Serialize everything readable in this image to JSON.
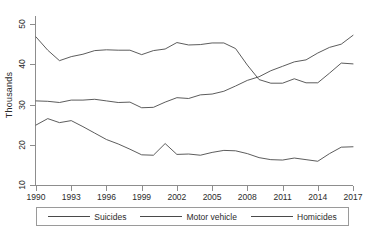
{
  "chart_data": {
    "type": "line",
    "title": "",
    "subtitle": "",
    "xlabel": "",
    "ylabel": "Thousands",
    "xlim": [
      1990,
      2017
    ],
    "ylim": [
      10,
      52
    ],
    "grid": false,
    "legend_position": "bottom",
    "x": [
      1990,
      1991,
      1992,
      1993,
      1994,
      1995,
      1996,
      1997,
      1998,
      1999,
      2000,
      2001,
      2002,
      2003,
      2004,
      2005,
      2006,
      2007,
      2008,
      2009,
      2010,
      2011,
      2012,
      2013,
      2014,
      2015,
      2016,
      2017
    ],
    "xticks": [
      1990,
      1993,
      1996,
      1999,
      2002,
      2005,
      2008,
      2011,
      2014,
      2017
    ],
    "xtick_labels": [
      "1990",
      "1993",
      "1996",
      "1999",
      "2002",
      "2005",
      "2008",
      "2011",
      "2014",
      "2017"
    ],
    "yticks": [
      10,
      20,
      30,
      40,
      50
    ],
    "ytick_labels": [
      "10",
      "20",
      "30",
      "40",
      "50"
    ],
    "series": [
      {
        "name": "Suicides",
        "color": "#4a4a4a",
        "values": [
          30.9,
          30.8,
          30.5,
          31.1,
          31.1,
          31.3,
          30.9,
          30.5,
          30.6,
          29.2,
          29.3,
          30.6,
          31.7,
          31.5,
          32.4,
          32.6,
          33.3,
          34.6,
          36.0,
          36.9,
          38.4,
          39.5,
          40.6,
          41.1,
          42.8,
          44.2,
          45.0,
          47.2
        ]
      },
      {
        "name": "Motor vehicle",
        "color": "#4a4a4a",
        "values": [
          46.8,
          43.5,
          40.9,
          41.9,
          42.5,
          43.4,
          43.6,
          43.5,
          43.5,
          42.4,
          43.4,
          43.8,
          45.4,
          44.8,
          44.9,
          45.3,
          45.3,
          43.9,
          39.8,
          36.2,
          35.3,
          35.3,
          36.4,
          35.4,
          35.4,
          37.8,
          40.3,
          40.1
        ]
      },
      {
        "name": "Homicides",
        "color": "#4a4a4a",
        "values": [
          24.9,
          26.5,
          25.5,
          26.0,
          24.5,
          22.9,
          21.3,
          20.2,
          18.9,
          17.5,
          17.4,
          20.3,
          17.6,
          17.7,
          17.4,
          18.1,
          18.6,
          18.5,
          17.8,
          16.8,
          16.3,
          16.2,
          16.7,
          16.3,
          15.9,
          17.8,
          19.4,
          19.5
        ]
      }
    ]
  },
  "legend": {
    "entries": [
      {
        "label": "Suicides"
      },
      {
        "label": "Motor vehicle"
      },
      {
        "label": "Homicides"
      }
    ]
  },
  "axes": {
    "y_title": "Thousands"
  }
}
